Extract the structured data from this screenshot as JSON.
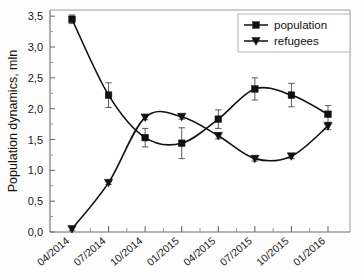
{
  "chart_data": {
    "type": "line",
    "title": "",
    "xlabel": "",
    "ylabel": "Population dynamics, mln",
    "categories": [
      "04/2014",
      "07/2014",
      "10/2014",
      "01/2015",
      "04/2015",
      "07/2015",
      "10/2015",
      "01/2016"
    ],
    "ylim": [
      0.0,
      3.6
    ],
    "yticks": [
      "0,0",
      "0,5",
      "1,0",
      "1,5",
      "2,0",
      "2,5",
      "3,0",
      "3,5"
    ],
    "ytick_values": [
      0.0,
      0.5,
      1.0,
      1.5,
      2.0,
      2.5,
      3.0,
      3.5
    ],
    "grid": false,
    "legend_position": "top-right",
    "decimal_separator": ",",
    "series": [
      {
        "name": "population",
        "marker": "square",
        "color": "#111111",
        "values": [
          3.45,
          2.22,
          1.53,
          1.44,
          1.83,
          2.32,
          2.22,
          1.91
        ],
        "errors": [
          0.07,
          0.2,
          0.15,
          0.25,
          0.15,
          0.18,
          0.19,
          0.14
        ]
      },
      {
        "name": "refugees",
        "marker": "triangle-down",
        "color": "#111111",
        "values": [
          0.05,
          0.8,
          1.86,
          1.87,
          1.56,
          1.19,
          1.23,
          1.72
        ],
        "errors": [
          0.03,
          0.03,
          0.04,
          0.04,
          0.05,
          0.04,
          0.04,
          0.06
        ]
      }
    ]
  },
  "legend": {
    "entries": [
      {
        "label": "population"
      },
      {
        "label": "refugees"
      }
    ]
  },
  "axes": {
    "y_axis_label": "Population dynamics, mln"
  }
}
